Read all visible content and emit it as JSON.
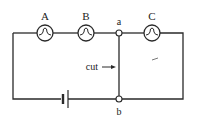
{
  "diagram": {
    "type": "circuit",
    "bulbs": [
      {
        "label": "A"
      },
      {
        "label": "B"
      },
      {
        "label": "C"
      }
    ],
    "nodes": [
      {
        "label": "a"
      },
      {
        "label": "b"
      }
    ],
    "annotation": {
      "label": "cut"
    },
    "stroke_color": "#2a2a2a"
  }
}
